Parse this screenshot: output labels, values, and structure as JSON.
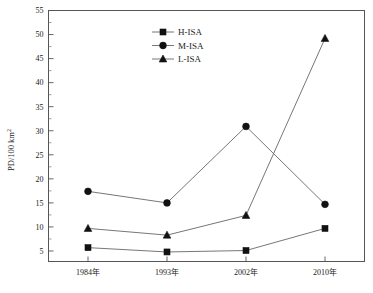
{
  "chart_data": {
    "type": "line",
    "title": "",
    "xlabel": "",
    "ylabel": "PD/100 km2",
    "ylabel_display": "PD/100 km",
    "ylabel_superscript": "2",
    "categories": [
      "1984年",
      "1993年",
      "2002年",
      "2010年"
    ],
    "ylim": [
      0,
      55
    ],
    "y_ticks": [
      5,
      10,
      15,
      20,
      25,
      30,
      35,
      40,
      45,
      50,
      55
    ],
    "y_tick_labels": [
      "5",
      "10",
      "15",
      "20",
      "25",
      "30",
      "35",
      "40",
      "45",
      "50",
      "55"
    ],
    "minor_ticks": true,
    "grid": false,
    "legend_position": "top-center",
    "series": [
      {
        "name": "H-ISA",
        "marker": "square",
        "values": [
          5.7,
          4.8,
          5.1,
          9.7
        ]
      },
      {
        "name": "M-ISA",
        "marker": "circle",
        "values": [
          17.4,
          15.0,
          30.9,
          14.7
        ]
      },
      {
        "name": "L-ISA",
        "marker": "triangle",
        "values": [
          9.7,
          8.3,
          12.4,
          49.2
        ]
      }
    ],
    "colors": {
      "line": "#777777",
      "marker": "#111111",
      "axis": "#555555",
      "background": "#ffffff"
    }
  },
  "legend": {
    "items": [
      {
        "label": "H-ISA",
        "marker": "square"
      },
      {
        "label": "M-ISA",
        "marker": "circle"
      },
      {
        "label": "L-ISA",
        "marker": "triangle"
      }
    ]
  }
}
